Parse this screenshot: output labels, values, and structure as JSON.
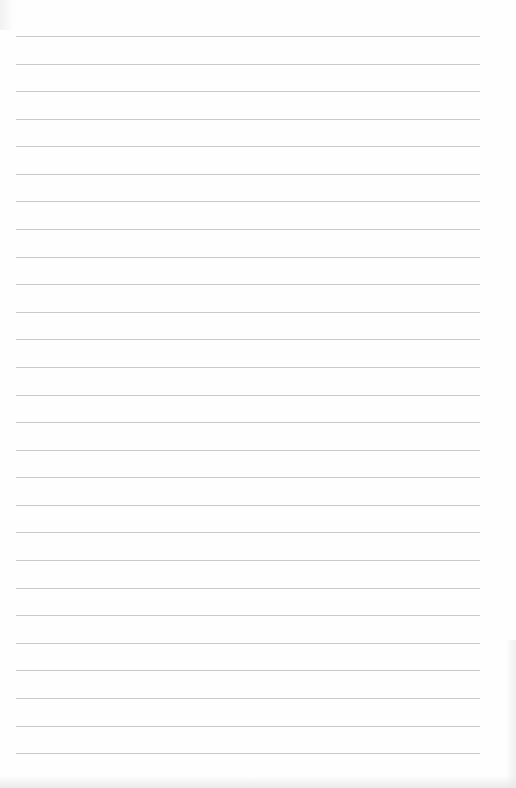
{
  "document": {
    "type": "blank lined paper",
    "line_count": 27,
    "first_line_y": 36,
    "line_spacing": 27.58,
    "line_left": 16,
    "line_width": 464,
    "line_color": "#c9c9c9",
    "paper_color": "#fefefe"
  }
}
